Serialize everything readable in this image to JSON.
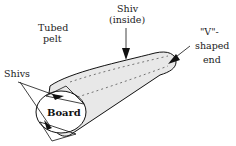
{
  "diagram": {
    "labels": {
      "tubed_pelt_line1": "Tubed",
      "tubed_pelt_line2": "pelt",
      "shiv_inside_line1": "Shiv",
      "shiv_inside_line2": "(inside)",
      "v_end_line1": "\"V\"-",
      "v_end_line2": "shaped",
      "v_end_line3": "end",
      "shivs": "Shivs",
      "board": "Board"
    },
    "colors": {
      "stroke": "#111111",
      "fill": "#e6e6e6",
      "background": "#ffffff"
    }
  }
}
